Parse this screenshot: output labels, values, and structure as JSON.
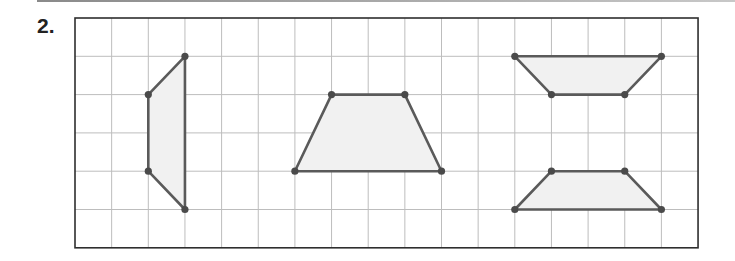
{
  "problem": {
    "label": "2."
  },
  "grid": {
    "origin_x": 75,
    "origin_y": 18,
    "cols": 17,
    "rows": 6,
    "cell_w": 36.65,
    "cell_h": 38.3,
    "grid_color": "#bdbdbd",
    "border_color": "#2e2e2e"
  },
  "style": {
    "stroke": "#5a5a5a",
    "fill": "#f1f1f1",
    "vertex": "#4a4a4a"
  },
  "shapes": [
    {
      "name": "left-trapezoid",
      "points": [
        [
          3,
          1
        ],
        [
          2,
          2
        ],
        [
          2,
          4
        ],
        [
          3,
          5
        ]
      ]
    },
    {
      "name": "middle-trapezoid",
      "points": [
        [
          7,
          2
        ],
        [
          9,
          2
        ],
        [
          10,
          4
        ],
        [
          6,
          4
        ]
      ]
    },
    {
      "name": "top-right-trapezoid",
      "points": [
        [
          12,
          1
        ],
        [
          16,
          1
        ],
        [
          15,
          2
        ],
        [
          13,
          2
        ]
      ]
    },
    {
      "name": "bottom-right-trapezoid",
      "points": [
        [
          13,
          4
        ],
        [
          15,
          4
        ],
        [
          16,
          5
        ],
        [
          12,
          5
        ]
      ]
    }
  ]
}
